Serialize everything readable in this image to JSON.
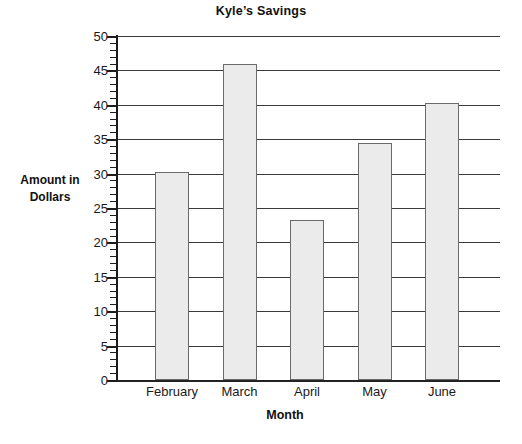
{
  "chart_data": {
    "type": "bar",
    "title": "Kyle’s Savings",
    "xlabel": "Month",
    "ylabel": "Amount in Dollars",
    "ylabel_line1": "Amount in",
    "ylabel_line2": "Dollars",
    "categories": [
      "February",
      "March",
      "April",
      "May",
      "June"
    ],
    "values": [
      30.2,
      46.0,
      23.3,
      34.5,
      40.2
    ],
    "ylim": [
      0,
      50
    ],
    "ytick_labels": [
      "0",
      "5",
      "10",
      "15",
      "20",
      "25",
      "30",
      "35",
      "40",
      "45",
      "50"
    ],
    "ytick_values": [
      0,
      5,
      10,
      15,
      20,
      25,
      30,
      35,
      40,
      45,
      50
    ],
    "minor_tick_step": 1,
    "grid": true,
    "legend": false,
    "bar_fill_color": "#ebebeb",
    "bar_border_color": "#6a6a6a",
    "axis_color": "#1c1c1c",
    "grid_color": "#3a3a3a"
  }
}
